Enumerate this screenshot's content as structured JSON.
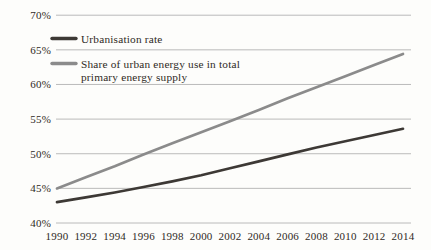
{
  "chart_data": {
    "type": "line",
    "title": "",
    "x": [
      1990,
      1992,
      1994,
      1996,
      1998,
      2000,
      2002,
      2004,
      2006,
      2008,
      2010,
      2012,
      2014
    ],
    "xtick_labels": [
      "1990",
      "1992",
      "1994",
      "1996",
      "1998",
      "2000",
      "2002",
      "2004",
      "2006",
      "2008",
      "2010",
      "2012",
      "2014"
    ],
    "series": [
      {
        "name": "Urbanisation rate",
        "legend_lines": [
          "Urbanisation rate"
        ],
        "color": "#3d3935",
        "values": [
          43.0,
          43.7,
          44.4,
          45.2,
          46.0,
          46.9,
          47.9,
          48.9,
          49.9,
          50.9,
          51.8,
          52.7,
          53.6
        ]
      },
      {
        "name": "Share of urban energy use in total primary energy supply",
        "legend_lines": [
          "Share of urban energy use in total",
          "primary energy supply"
        ],
        "color": "#8b8b8b",
        "values": [
          45.0,
          46.6,
          48.2,
          49.9,
          51.5,
          53.1,
          54.7,
          56.3,
          58.0,
          59.6,
          61.2,
          62.8,
          64.4
        ]
      }
    ],
    "ylim": [
      40,
      70
    ],
    "yticks": [
      40,
      45,
      50,
      55,
      60,
      65,
      70
    ],
    "ytick_labels": [
      "40%",
      "45%",
      "50%",
      "55%",
      "60%",
      "65%",
      "70%"
    ],
    "grid": "horizontal",
    "legend_position": "top-left",
    "colors": {
      "grid": "#b2b2b2",
      "text": "#2f2a25",
      "background": "#fdfdfb"
    }
  }
}
